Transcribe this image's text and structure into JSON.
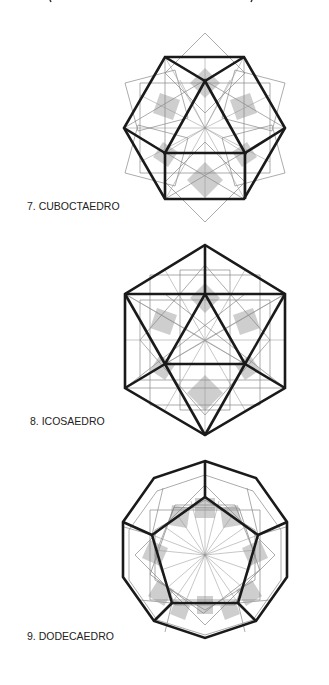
{
  "figures": [
    {
      "id": "cuboctaedro",
      "label": "7. CUBOCTAEDRO",
      "center": [
        205,
        128
      ]
    },
    {
      "id": "icosaedro",
      "label": "8. ICOSAEDRO",
      "center": [
        205,
        340
      ]
    },
    {
      "id": "dodecaedro",
      "label": "9. DODECAEDRO",
      "center": [
        205,
        555
      ]
    }
  ],
  "colors": {
    "bold_edge": "#1a1a1a",
    "thin_line": "#888888",
    "shade": "#bdbdbd",
    "background": "#ffffff"
  }
}
